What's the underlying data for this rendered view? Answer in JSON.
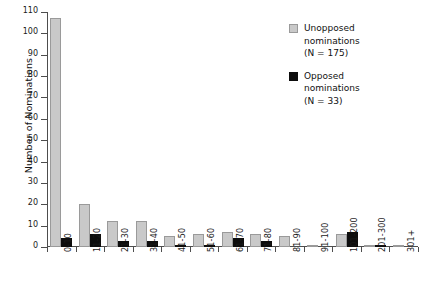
{
  "chart_data": {
    "type": "bar",
    "title": "",
    "xlabel": "",
    "ylabel": "Number of Nominations",
    "ylim": [
      0,
      110
    ],
    "ytick_step": 10,
    "grid": false,
    "legend_position": "top-right",
    "categories": [
      "0-10",
      "11-20",
      "21-30",
      "31-40",
      "41-50",
      "51-60",
      "61-70",
      "71-80",
      "81-90",
      "91-100",
      "101-200",
      "201-300",
      "301+"
    ],
    "ytick_labels": [
      "0",
      "10",
      "20",
      "30",
      "40",
      "50",
      "60",
      "70",
      "80",
      "90",
      "100",
      "110"
    ],
    "series": [
      {
        "name": "Unopposed nominations",
        "count_label": "(N = 175)",
        "color": "#c9c9c9",
        "values": [
          107,
          20,
          12,
          12,
          5,
          6,
          7,
          6,
          5,
          1,
          6,
          1,
          1
        ]
      },
      {
        "name": "Opposed nominations",
        "count_label": "(N = 33)",
        "color": "#0d0d0d",
        "values": [
          4,
          6,
          3,
          3,
          1,
          1,
          4,
          3,
          0,
          0,
          7,
          1,
          0
        ]
      }
    ]
  },
  "legend": {
    "entries": [
      {
        "label_line1": "Unopposed",
        "label_line2": "nominations",
        "label_line3": "(N = 175)",
        "swatch": "unopposed"
      },
      {
        "label_line1": "Opposed",
        "label_line2": "nominations",
        "label_line3": "(N = 33)",
        "swatch": "opposed"
      }
    ]
  }
}
